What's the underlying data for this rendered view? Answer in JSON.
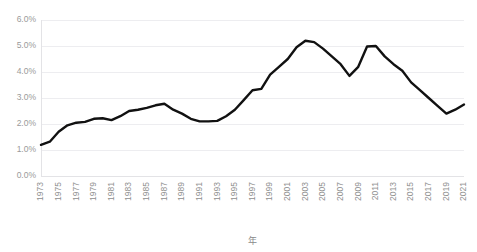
{
  "chart_data": {
    "type": "line",
    "title": "",
    "subtitle": "",
    "xlabel": "年",
    "ylabel": "",
    "xlim": [
      1973,
      2021
    ],
    "ylim": [
      0.0,
      6.0
    ],
    "grid": true,
    "legend_position": "none",
    "y_tick_labels": [
      "0.0%",
      "1.0%",
      "2.0%",
      "3.0%",
      "4.0%",
      "5.0%",
      "6.0%"
    ],
    "y_tick_values": [
      0.0,
      1.0,
      2.0,
      3.0,
      4.0,
      5.0,
      6.0
    ],
    "x_tick_labels": [
      "1973",
      "1975",
      "1977",
      "1979",
      "1981",
      "1983",
      "1985",
      "1987",
      "1989",
      "1991",
      "1993",
      "1995",
      "1997",
      "1999",
      "2001",
      "2003",
      "2005",
      "2007",
      "2009",
      "2011",
      "2013",
      "2015",
      "2017",
      "2019",
      "2021"
    ],
    "x": [
      1973,
      1974,
      1975,
      1976,
      1977,
      1978,
      1979,
      1980,
      1981,
      1982,
      1983,
      1984,
      1985,
      1986,
      1987,
      1988,
      1989,
      1990,
      1991,
      1992,
      1993,
      1994,
      1995,
      1996,
      1997,
      1998,
      1999,
      2000,
      2001,
      2002,
      2003,
      2004,
      2005,
      2006,
      2007,
      2008,
      2009,
      2010,
      2011,
      2012,
      2013,
      2014,
      2015,
      2016,
      2017,
      2018,
      2019,
      2020,
      2021
    ],
    "series": [
      {
        "name": "占比",
        "color": "#111111",
        "values": [
          1.2,
          1.32,
          1.7,
          1.95,
          2.05,
          2.08,
          2.2,
          2.22,
          2.15,
          2.3,
          2.5,
          2.55,
          2.62,
          2.72,
          2.78,
          2.55,
          2.4,
          2.2,
          2.1,
          2.1,
          2.12,
          2.3,
          2.55,
          2.92,
          3.3,
          3.35,
          3.9,
          4.2,
          4.5,
          4.95,
          5.2,
          5.15,
          4.9,
          4.6,
          4.3,
          3.85,
          4.2,
          4.98,
          5.0,
          4.6,
          4.3,
          4.05,
          3.6,
          3.3,
          3.0,
          2.7,
          2.4,
          2.55,
          2.75
        ]
      }
    ]
  },
  "axes": {
    "y_axis_name": "percentage-axis",
    "x_axis_name": "year-axis"
  }
}
